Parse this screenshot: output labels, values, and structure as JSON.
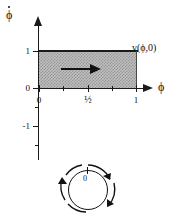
{
  "figure": {
    "type": "phase-diagram",
    "title": "",
    "axes": {
      "x": {
        "label": "ϕ",
        "ticks_major": [
          0,
          0.5,
          1
        ],
        "tick_labels": [
          "0",
          "½",
          "1"
        ],
        "ticks_minor": [
          0.25,
          0.75
        ],
        "range": [
          -0.08,
          1.1
        ]
      },
      "y": {
        "label": "ϕ̇",
        "tick_labels": [
          "1",
          "0",
          "-1"
        ],
        "ticks": [
          1,
          0,
          -1
        ],
        "range": [
          -1.6,
          1.7
        ]
      }
    },
    "region": {
      "name": "shaded-band",
      "x_from": 0,
      "x_to": 1,
      "y_from": 0,
      "y_to": 1,
      "fill": "#bdbdbd",
      "pattern": "hatched"
    },
    "annotations": {
      "field_label": "v(ϕ,0)",
      "flow_arrow_direction": "right"
    },
    "circle_diagram": {
      "origin_label": "0",
      "rotation": "counterclockwise",
      "description": "circle-with-rotation-arrows"
    },
    "colors": {
      "ink": "#111111",
      "shade": "#bdbdbd",
      "background": "#ffffff"
    }
  }
}
